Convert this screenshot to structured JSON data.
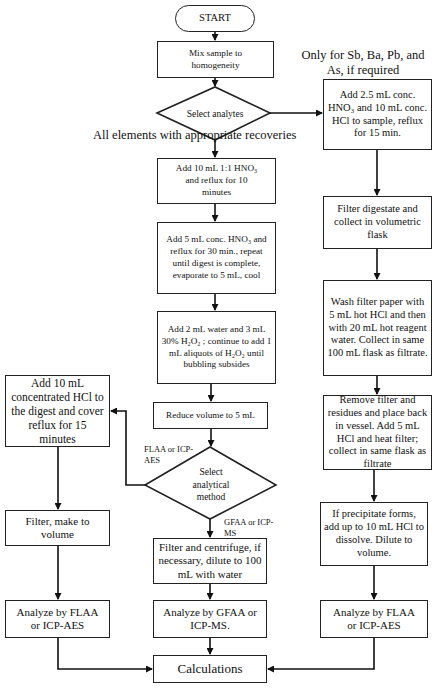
{
  "flowchart": {
    "start": "START",
    "mix": "Mix sample to homogeneity",
    "select_analytes": "Select analytes",
    "note_all": "All elements with appropriate recoveries",
    "note_only": "Only for Sb, Ba, Pb, and As, if required",
    "center": {
      "step1": "Add 10 mL 1:1 HNO₃ and reflux for 10 minutes",
      "step2": "Add 5 mL conc. HNO₃ and reflux for 30 min., repeat until digest is complete, evaporate to 5 mL, cool",
      "step3": "Add 2 mL water and 3 mL 30% H₂O₂ ; continue to add 1 mL aliquots of H₂O₂ until bubbling subsides",
      "reduce": "Reduce volume to 5 mL",
      "select_method": "Select analytical method",
      "branch_left": "FLAA or ICP-AES",
      "branch_down": "GFAA or ICP-MS",
      "filter_centrifuge": "Filter and centrifuge, if necessary, dilute to 100 mL with water",
      "analyze": "Analyze by GFAA or ICP-MS."
    },
    "left": {
      "add_hcl": "Add 10 mL concentrated HCl to the digest and cover reflux for 15 minutes",
      "filter": "Filter, make to volume",
      "analyze": "Analyze by FLAA or ICP-AES"
    },
    "right": {
      "add": "Add 2.5 mL conc. HNO₃ and 10 mL conc. HCl to sample, reflux for 15 min.",
      "filter": "Filter digestate and collect in volumetric flask",
      "wash": "Wash filter paper with 5 mL hot HCl and then with 20 mL hot reagent water. Collect in same 100 mL flask as filtrate.",
      "remove": "Remove filter and residues and place back in vessel. Add 5 mL HCl and heat filter; collect in same flask as filtrate",
      "precipitate": "If precipitate forms, add up to 10 mL HCl to dissolve. Dilute to volume.",
      "analyze": "Analyze by FLAA or ICP-AES"
    },
    "calculations": "Calculations"
  }
}
